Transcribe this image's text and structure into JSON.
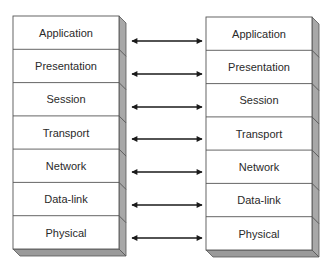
{
  "diagram": {
    "type": "osi-model-peer-communication",
    "left_stack": {
      "layers": [
        {
          "label": "Application"
        },
        {
          "label": "Presentation"
        },
        {
          "label": "Session"
        },
        {
          "label": "Transport"
        },
        {
          "label": "Network"
        },
        {
          "label": "Data-link"
        },
        {
          "label": "Physical"
        }
      ]
    },
    "right_stack": {
      "layers": [
        {
          "label": "Application"
        },
        {
          "label": "Presentation"
        },
        {
          "label": "Session"
        },
        {
          "label": "Transport"
        },
        {
          "label": "Network"
        },
        {
          "label": "Data-link"
        },
        {
          "label": "Physical"
        }
      ]
    },
    "connections": [
      {
        "from": "Application",
        "to": "Application",
        "style": "bidirectional-arrow"
      },
      {
        "from": "Presentation",
        "to": "Presentation",
        "style": "bidirectional-arrow"
      },
      {
        "from": "Session",
        "to": "Session",
        "style": "bidirectional-arrow"
      },
      {
        "from": "Transport",
        "to": "Transport",
        "style": "bidirectional-arrow"
      },
      {
        "from": "Network",
        "to": "Network",
        "style": "bidirectional-arrow"
      },
      {
        "from": "Data-link",
        "to": "Data-link",
        "style": "bidirectional-arrow"
      },
      {
        "from": "Physical",
        "to": "Physical",
        "style": "bidirectional-arrow"
      }
    ],
    "colors": {
      "face": "#ffffff",
      "bevel": "#a8a8a8",
      "outline": "#555555",
      "arrow": "#1a1a1a",
      "text": "#2a2a2a"
    }
  }
}
